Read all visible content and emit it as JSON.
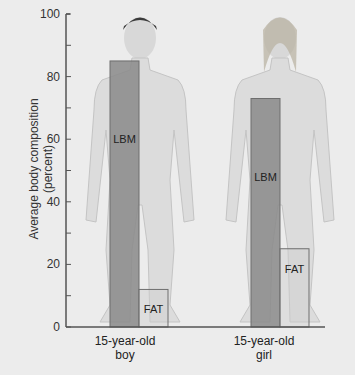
{
  "chart_data": {
    "type": "bar",
    "title": "",
    "xlabel": "",
    "ylabel": "Average body composition (percent)",
    "ylabel_lines": [
      "Average body composition",
      "(percent)"
    ],
    "ylim": [
      0,
      100
    ],
    "yticks": [
      0,
      20,
      40,
      60,
      80,
      100
    ],
    "grid": false,
    "categories": [
      "15-year-old boy",
      "15-year-old girl"
    ],
    "category_lines": [
      [
        "15-year-old",
        "boy"
      ],
      [
        "15-year-old",
        "girl"
      ]
    ],
    "series": [
      {
        "name": "LBM",
        "values": [
          85,
          73
        ],
        "color": "#8a8a8a"
      },
      {
        "name": "FAT",
        "values": [
          12,
          25
        ],
        "color": "#bdbdbd"
      }
    ],
    "annotations": [
      "LBM",
      "FAT",
      "LBM",
      "FAT"
    ],
    "background_figures": [
      "boy-silhouette",
      "girl-silhouette"
    ]
  },
  "colors": {
    "background": "#ececec",
    "axis": "#555555",
    "lbm_bar": "#8a8a8a",
    "fat_bar": "#cfcfcf",
    "figure_skin": "#dcdcdc"
  }
}
